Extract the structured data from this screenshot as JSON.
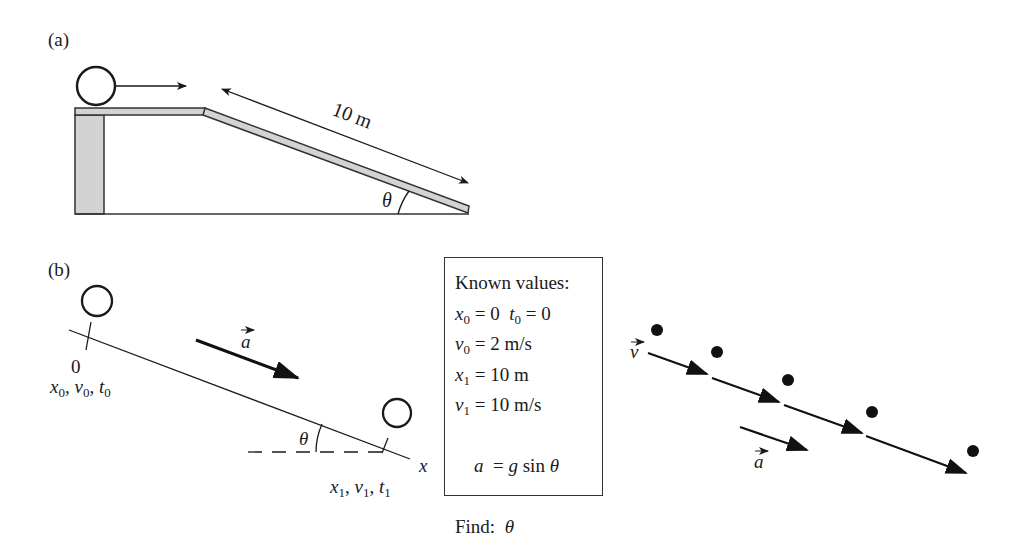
{
  "panel_a": {
    "label": "(a)",
    "ramp_length_label": "10 m",
    "angle_label": "θ"
  },
  "panel_b": {
    "label": "(b)",
    "origin_label": "0",
    "start_vars": {
      "x": "x",
      "x_sub": "0",
      "v": "v",
      "v_sub": "0",
      "t": "t",
      "t_sub": "0"
    },
    "end_vars": {
      "x": "x",
      "x_sub": "1",
      "v": "v",
      "v_sub": "1",
      "t": "t",
      "t_sub": "1"
    },
    "axis_label": "x",
    "accel_label": "a",
    "angle_label": "θ"
  },
  "known_values": {
    "title": "Known values:",
    "rows": [
      {
        "lhs": "x",
        "sub": "0",
        "eq": " = 0",
        "lhs2": "t",
        "sub2": "0",
        "eq2": " = 0"
      },
      {
        "lhs": "v",
        "sub": "0",
        "eq": " = 2 m/s"
      },
      {
        "lhs": "x",
        "sub": "1",
        "eq": " = 10 m"
      },
      {
        "lhs": "v",
        "sub": "1",
        "eq": " = 10 m/s"
      },
      {
        "lhs": "a",
        "eq": "  = ",
        "g": "g",
        "rest": " sin ",
        "theta": "θ"
      }
    ],
    "find_label": "Find:",
    "find_value": "θ"
  },
  "motion_diagram": {
    "velocity_label": "v",
    "accel_label": "a",
    "dot_count": 5
  }
}
